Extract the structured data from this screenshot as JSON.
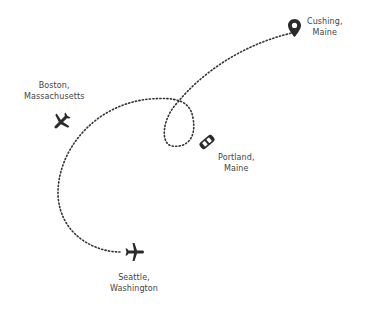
{
  "map": {
    "route_color": "#333333",
    "icon_color": "#2a2a2a",
    "locations": [
      {
        "id": "cushing",
        "line1": "Cushing,",
        "line2": "Maine",
        "icon": "map-pin-icon"
      },
      {
        "id": "boston",
        "line1": "Boston,",
        "line2": "Massachusetts",
        "icon": "airplane-icon"
      },
      {
        "id": "portland",
        "line1": "Portland,",
        "line2": "Maine",
        "icon": "car-icon"
      },
      {
        "id": "seattle",
        "line1": "Seattle,",
        "line2": "Washington",
        "icon": "airplane-icon"
      }
    ]
  }
}
